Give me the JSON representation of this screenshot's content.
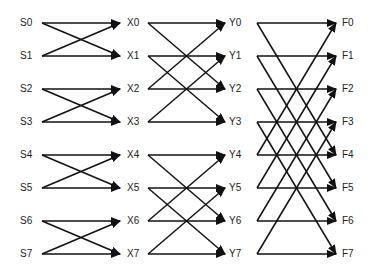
{
  "diagram": {
    "type": "butterfly-network",
    "stages": [
      {
        "name": "input",
        "labels": [
          "S0",
          "S1",
          "S2",
          "S3",
          "S4",
          "S5",
          "S6",
          "S7"
        ]
      },
      {
        "name": "stage1",
        "labels": [
          "X0",
          "X1",
          "X2",
          "X3",
          "X4",
          "X5",
          "X6",
          "X7"
        ]
      },
      {
        "name": "stage2",
        "labels": [
          "Y0",
          "Y1",
          "Y2",
          "Y3",
          "Y4",
          "Y5",
          "Y6",
          "Y7"
        ]
      },
      {
        "name": "output",
        "labels": [
          "F0",
          "F1",
          "F2",
          "F3",
          "F4",
          "F5",
          "F6",
          "F7"
        ]
      }
    ],
    "edges": [
      {
        "from_stage": 0,
        "span": 1
      },
      {
        "from_stage": 1,
        "span": 2
      },
      {
        "from_stage": 2,
        "span": 4
      }
    ],
    "line_color": "#111111"
  }
}
